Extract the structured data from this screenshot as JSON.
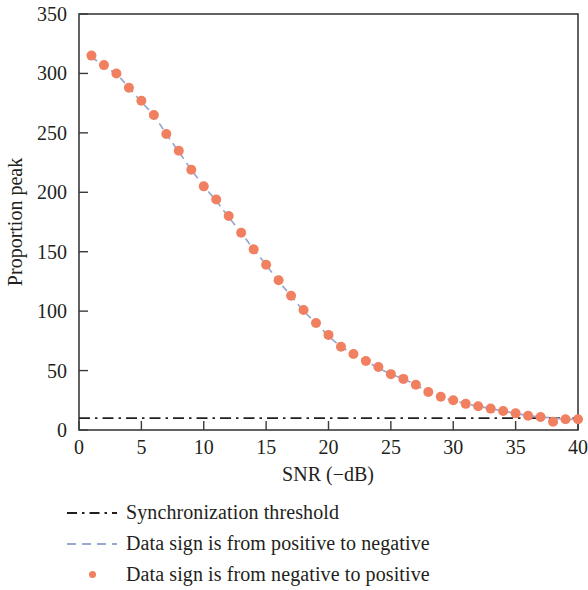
{
  "chart_data": {
    "type": "scatter",
    "title": "",
    "xlabel": "SNR (−dB)",
    "ylabel": "Proportion peak",
    "xlim": [
      0,
      40
    ],
    "ylim": [
      0,
      350
    ],
    "xticks": [
      0,
      5,
      10,
      15,
      20,
      25,
      30,
      35,
      40
    ],
    "xtick_labels": [
      "0",
      "5",
      "10",
      "15",
      "20",
      "25",
      "30",
      "35",
      "40"
    ],
    "yticks": [
      0,
      50,
      100,
      150,
      200,
      250,
      300,
      350
    ],
    "ytick_labels": [
      "0",
      "50",
      "100",
      "150",
      "200",
      "250",
      "300",
      "350"
    ],
    "grid": false,
    "legend_position": "below-axes",
    "series": [
      {
        "name": "Synchronization threshold",
        "type": "line",
        "style": "dash-dot",
        "color": "#231f20",
        "constant_value": 10,
        "x": [
          0,
          40
        ],
        "values": [
          10,
          10
        ]
      },
      {
        "name": "Data sign is from positive to negative",
        "type": "line",
        "style": "dashed",
        "color": "#9aa7d0",
        "x": [
          1,
          2,
          3,
          4,
          5,
          6,
          7,
          8,
          9,
          10,
          11,
          12,
          13,
          14,
          15,
          16,
          17,
          18,
          19,
          20,
          21,
          22,
          23,
          24,
          25,
          26,
          27,
          28,
          29,
          30,
          31,
          32,
          33,
          34,
          35,
          36,
          37,
          38,
          39,
          40
        ],
        "values": [
          314,
          306,
          300,
          288,
          276,
          265,
          249,
          234,
          219,
          205,
          193,
          179,
          166,
          152,
          139,
          125,
          113,
          100,
          90,
          79,
          70,
          64,
          58,
          52,
          47,
          43,
          38,
          32,
          27,
          25,
          22,
          20,
          18,
          16,
          14,
          12,
          11,
          10,
          9,
          9
        ]
      },
      {
        "name": "Data sign is from negative to positive",
        "type": "scatter",
        "style": "markers",
        "color": "#f08060",
        "marker": "circle",
        "x": [
          1,
          2,
          3,
          4,
          5,
          6,
          7,
          8,
          9,
          10,
          11,
          12,
          13,
          14,
          15,
          16,
          17,
          18,
          19,
          20,
          21,
          22,
          23,
          24,
          25,
          26,
          27,
          28,
          29,
          30,
          31,
          32,
          33,
          34,
          35,
          36,
          37,
          38,
          39,
          40
        ],
        "values": [
          315,
          307,
          300,
          288,
          277,
          265,
          249,
          235,
          219,
          205,
          194,
          180,
          166,
          152,
          139,
          126,
          113,
          101,
          90,
          80,
          70,
          64,
          58,
          53,
          47,
          43,
          38,
          32,
          28,
          25,
          22,
          20,
          18,
          16,
          14,
          12,
          11,
          7,
          9,
          9
        ]
      }
    ]
  },
  "axes": {
    "xlabel": "SNR (−dB)",
    "ylabel": "Proportion peak",
    "xtick_labels": [
      "0",
      "5",
      "10",
      "15",
      "20",
      "25",
      "30",
      "35",
      "40"
    ],
    "ytick_labels": [
      "0",
      "50",
      "100",
      "150",
      "200",
      "250",
      "300",
      "350"
    ]
  },
  "legend": {
    "items": [
      {
        "label": "Synchronization threshold",
        "key": "dash-dot-line-key",
        "color": "#231f20"
      },
      {
        "label": "Data sign is from positive to negative",
        "key": "dashed-line-key",
        "color": "#9aa7d0"
      },
      {
        "label": "Data sign is from negative to positive",
        "key": "dot-marker-key",
        "color": "#f08060"
      }
    ]
  },
  "colors": {
    "marker": "#f08060",
    "trend_line": "#9aa7d0",
    "threshold_line": "#231f20",
    "axis": "#3b3b3b",
    "text": "#231f20",
    "background": "#ffffff"
  }
}
